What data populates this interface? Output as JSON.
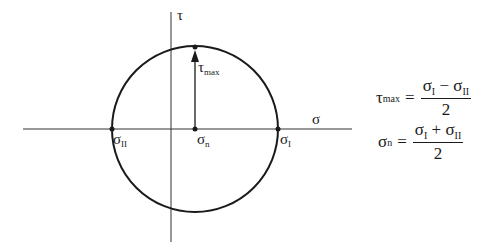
{
  "diagram": {
    "axes": {
      "horizontal": {
        "symbol": "σ"
      },
      "vertical": {
        "symbol": "τ"
      }
    },
    "points": {
      "sigma_I": {
        "symbol": "σ",
        "sub": "I"
      },
      "sigma_II": {
        "symbol": "σ",
        "sub": "II"
      },
      "sigma_n": {
        "symbol": "σ",
        "sub": "n"
      },
      "tau_max": {
        "symbol": "τ",
        "sub": "max"
      }
    },
    "equations": [
      {
        "lhs_symbol": "τ",
        "lhs_sub": "max",
        "equals": "=",
        "num_a": "σ",
        "num_a_sub": "I",
        "op": " − ",
        "num_b": "σ",
        "num_b_sub": "II",
        "den": "2"
      },
      {
        "lhs_symbol": "σ",
        "lhs_sub": "n",
        "equals": "=",
        "num_a": "σ",
        "num_a_sub": "I",
        "op": " + ",
        "num_b": "σ",
        "num_b_sub": "II",
        "den": "2"
      }
    ],
    "colors": {
      "stroke": "#1a1a1a",
      "axis": "#333333"
    }
  }
}
